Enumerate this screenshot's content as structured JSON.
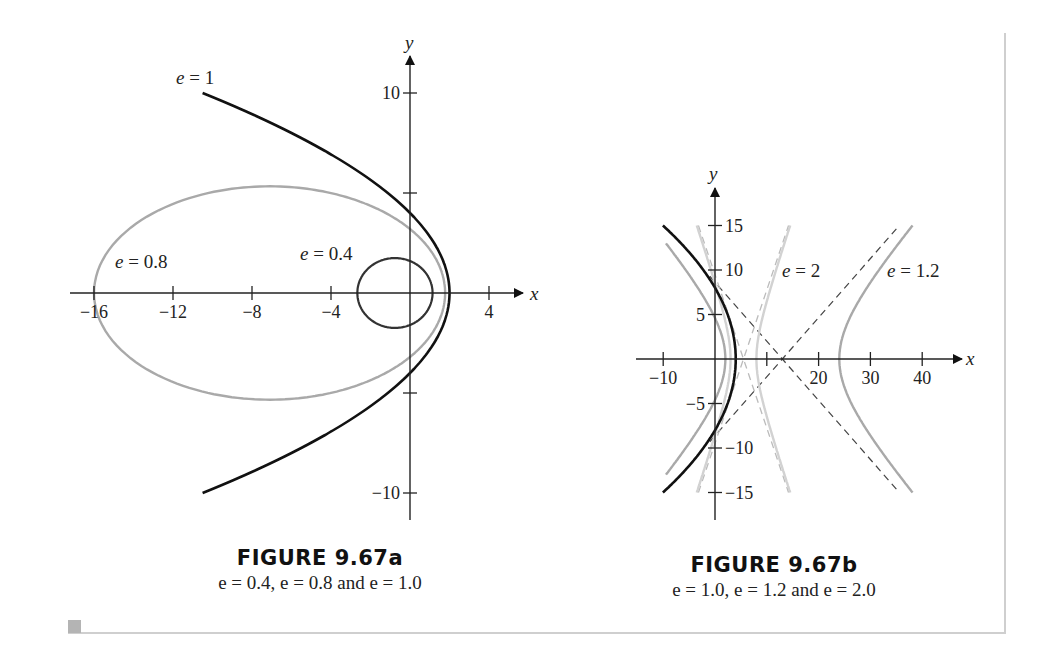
{
  "figure_a": {
    "title": "FIGURE 9.67a",
    "subtitle": "e = 0.4, e = 0.8 and e = 1.0"
  },
  "figure_b": {
    "title": "FIGURE 9.67b",
    "subtitle": "e = 1.0, e = 1.2 and e = 2.0"
  },
  "colors": {
    "black_curve": "#111111",
    "medium_gray_curve": "#a9a9a9",
    "light_gray_curve": "#d2d2d2",
    "asymptote_dash": "#444444",
    "axis": "#222222"
  },
  "chart_data": [
    {
      "type": "line",
      "title": "FIGURE 9.67a",
      "subtitle": "e = 0.4, e = 0.8 and e = 1.0",
      "xlabel": "x",
      "ylabel": "y",
      "x_ticks": [
        -16,
        -12,
        -8,
        -4,
        4
      ],
      "y_ticks": [
        10,
        -10
      ],
      "y_ticks_unlabeled": [
        5,
        -5
      ],
      "xlim": [
        -17,
        6
      ],
      "ylim": [
        -11.5,
        12
      ],
      "grid": false,
      "series": [
        {
          "name": "e = 1",
          "conic": "r = 4/(1+cos θ)",
          "kind": "parabola",
          "vertex": [
            2,
            0
          ],
          "y_intercepts": [
            4,
            -4
          ],
          "endpoints": [
            [
              -10.5,
              10
            ],
            [
              -10.5,
              -10
            ]
          ],
          "color": "black"
        },
        {
          "name": "e = 0.8",
          "conic": "r = 3.2/(1+0.8 cos θ)",
          "kind": "ellipse",
          "x_extent": [
            -16,
            1.78
          ],
          "y_extent": [
            -5.33,
            5.33
          ],
          "color": "gray"
        },
        {
          "name": "e = 0.4",
          "conic": "r = 1.6/(1+0.4 cos θ)",
          "kind": "ellipse",
          "x_extent": [
            -2.67,
            1.14
          ],
          "y_extent": [
            -1.75,
            1.75
          ],
          "color": "dark"
        }
      ],
      "annotations": [
        {
          "text": "e = 1",
          "x": -10.5,
          "y": 11.3
        },
        {
          "text": "e = 0.8",
          "x": -15,
          "y": 1.5
        },
        {
          "text": "e = 0.4",
          "x": -5.5,
          "y": 2
        }
      ]
    },
    {
      "type": "line",
      "title": "FIGURE 9.67b",
      "subtitle": "e = 1.0, e = 1.2 and e = 2.0",
      "xlabel": "x",
      "ylabel": "y",
      "x_ticks": [
        -10,
        20,
        30,
        40
      ],
      "x_ticks_unlabeled": [
        10
      ],
      "y_ticks": [
        15,
        10,
        5,
        -5,
        -10,
        -15
      ],
      "xlim": [
        -13,
        48
      ],
      "ylim": [
        -19,
        20
      ],
      "grid": false,
      "series": [
        {
          "name": "e = 1",
          "kind": "parabola",
          "vertex": [
            4,
            0
          ],
          "y_intercepts": [
            8,
            -8
          ],
          "x_range": [
            -10,
            4
          ],
          "color": "black"
        },
        {
          "name": "e = 1.2",
          "kind": "hyperbola",
          "center": [
            13,
            0
          ],
          "a": 11,
          "b": 7.3,
          "vertices": [
            2,
            24
          ],
          "asymptotes": "y = ±0.66(x − 13)",
          "color": "medium gray"
        },
        {
          "name": "e = 2",
          "kind": "hyperbola",
          "center": [
            5.5,
            0
          ],
          "a": 2.5,
          "b": 4.33,
          "vertices": [
            3,
            8
          ],
          "asymptotes": "y = ±1.73(x − 5.5)",
          "color": "light gray"
        }
      ],
      "annotations": [
        {
          "text": "e = 2",
          "x": 13,
          "y": 10
        },
        {
          "text": "e = 1.2",
          "x": 33,
          "y": 10
        }
      ]
    }
  ]
}
